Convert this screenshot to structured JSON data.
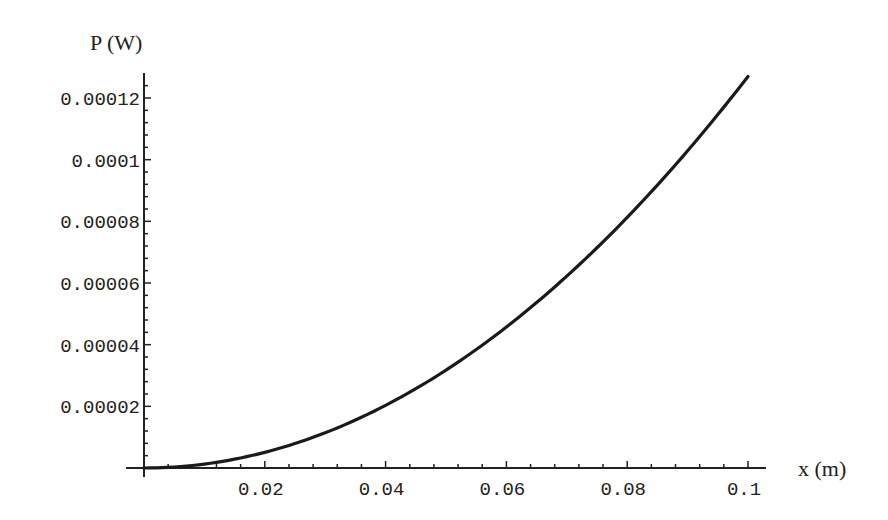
{
  "chart_data": {
    "type": "line",
    "title": "",
    "xlabel": "x (m)",
    "ylabel": "P (W)",
    "xlim": [
      0,
      0.1
    ],
    "ylim": [
      0,
      0.000128
    ],
    "grid": false,
    "legend": null,
    "x_ticks": [
      "0.02",
      "0.04",
      "0.06",
      "0.08",
      "0.1"
    ],
    "y_ticks": [
      "0.00002",
      "0.00004",
      "0.00006",
      "0.00008",
      "0.0001",
      "0.00012"
    ],
    "series": [
      {
        "name": "P(x)",
        "x": [
          0,
          0.01,
          0.02,
          0.03,
          0.04,
          0.05,
          0.06,
          0.07,
          0.08,
          0.09,
          0.1
        ],
        "values": [
          0,
          1.3e-06,
          5.1e-06,
          1.14e-05,
          2.03e-05,
          3.17e-05,
          4.57e-05,
          6.22e-05,
          8.13e-05,
          0.0001029,
          0.000127
        ]
      }
    ]
  },
  "colors": {
    "axis": "#222222",
    "curve": "#1a1a1a",
    "background": "#ffffff"
  }
}
